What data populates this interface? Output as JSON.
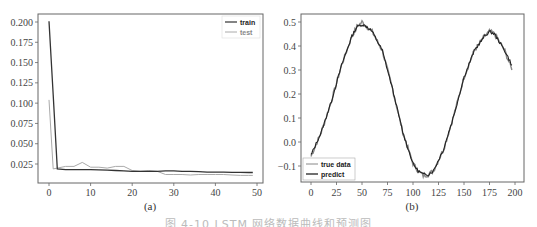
{
  "caption": "图 4-10 LSTM 网络数据曲线和预测图",
  "chart_data": [
    {
      "type": "line",
      "subtitle": "(a)",
      "title": "",
      "xlabel": "",
      "ylabel": "",
      "xlim": [
        -2,
        51
      ],
      "ylim": [
        0.01,
        0.205
      ],
      "xticks": [
        0,
        10,
        20,
        30,
        40,
        50
      ],
      "yticks": [
        "0.025",
        "0.050",
        "0.075",
        "0.100",
        "0.125",
        "0.150",
        "0.175",
        "0.200"
      ],
      "grid": false,
      "legend_position": "upper right",
      "x": [
        0,
        1,
        2,
        4,
        6,
        8,
        10,
        12,
        14,
        16,
        18,
        20,
        22,
        24,
        26,
        28,
        30,
        32,
        34,
        36,
        38,
        40,
        42,
        44,
        46,
        48,
        49
      ],
      "series": [
        {
          "name": "train",
          "color": "#333333",
          "values": [
            0.201,
            0.11,
            0.019,
            0.018,
            0.018,
            0.018,
            0.018,
            0.0178,
            0.0175,
            0.017,
            0.0165,
            0.016,
            0.016,
            0.016,
            0.016,
            0.0165,
            0.0165,
            0.016,
            0.016,
            0.0155,
            0.015,
            0.015,
            0.015,
            0.0148,
            0.0146,
            0.0145,
            0.0145
          ]
        },
        {
          "name": "test",
          "color": "#aaaaaa",
          "values": [
            0.104,
            0.019,
            0.02,
            0.022,
            0.022,
            0.027,
            0.021,
            0.021,
            0.02,
            0.022,
            0.022,
            0.017,
            0.016,
            0.017,
            0.016,
            0.012,
            0.012,
            0.012,
            0.0115,
            0.012,
            0.012,
            0.012,
            0.012,
            0.0115,
            0.011,
            0.011,
            0.011
          ]
        }
      ]
    },
    {
      "type": "line",
      "subtitle": "(b)",
      "title": "",
      "xlabel": "",
      "ylabel": "",
      "xlim": [
        -10,
        210
      ],
      "ylim": [
        -0.17,
        0.52
      ],
      "xticks": [
        0,
        25,
        50,
        75,
        100,
        125,
        150,
        175,
        200
      ],
      "yticks": [
        "-0.1",
        "0.0",
        "0.1",
        "0.2",
        "0.3",
        "0.4",
        "0.5"
      ],
      "grid": false,
      "legend_position": "lower left",
      "x": [
        0,
        10,
        20,
        30,
        40,
        45,
        50,
        55,
        60,
        70,
        80,
        90,
        100,
        105,
        110,
        115,
        120,
        130,
        140,
        150,
        160,
        170,
        175,
        180,
        190,
        197
      ],
      "series": [
        {
          "name": "true data",
          "color": "#888888",
          "values": [
            -0.06,
            0.04,
            0.17,
            0.32,
            0.44,
            0.48,
            0.5,
            0.48,
            0.46,
            0.38,
            0.22,
            0.04,
            -0.09,
            -0.12,
            -0.14,
            -0.135,
            -0.12,
            -0.03,
            0.11,
            0.27,
            0.38,
            0.44,
            0.46,
            0.45,
            0.38,
            0.3
          ]
        },
        {
          "name": "predict",
          "color": "#222222",
          "values": [
            -0.055,
            0.04,
            0.17,
            0.32,
            0.44,
            0.48,
            0.49,
            0.48,
            0.46,
            0.38,
            0.22,
            0.04,
            -0.09,
            -0.12,
            -0.135,
            -0.135,
            -0.12,
            -0.03,
            0.11,
            0.27,
            0.38,
            0.44,
            0.46,
            0.45,
            0.38,
            0.32
          ]
        }
      ]
    }
  ]
}
